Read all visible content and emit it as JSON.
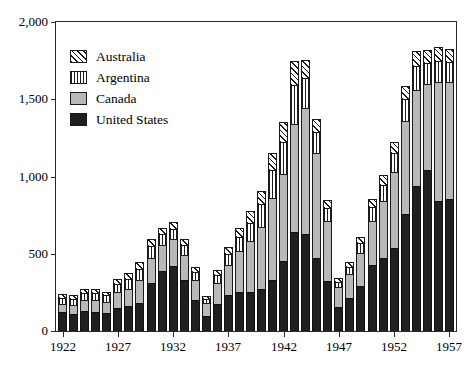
{
  "chart_data": {
    "type": "bar",
    "subtype": "stacked-vertical",
    "title": "",
    "subtitle": "",
    "xlabel": "",
    "ylabel": "",
    "grid": false,
    "legend_position": "upper-left-inside",
    "xlim": [
      1921.4,
      1957.6
    ],
    "ylim": [
      0,
      2000
    ],
    "ytick_values": [
      0,
      500,
      1000,
      1500,
      2000
    ],
    "ytick_labels": [
      "0",
      "500",
      "1,000",
      "1,500",
      "2,000"
    ],
    "xtick_values": [
      1922,
      1927,
      1932,
      1937,
      1942,
      1947,
      1952,
      1957
    ],
    "xtick_labels": [
      "1922",
      "1927",
      "1932",
      "1937",
      "1942",
      "1947",
      "1952",
      "1957"
    ],
    "x": [
      1922,
      1923,
      1924,
      1925,
      1926,
      1927,
      1928,
      1929,
      1930,
      1931,
      1932,
      1933,
      1934,
      1935,
      1936,
      1937,
      1938,
      1939,
      1940,
      1941,
      1942,
      1943,
      1944,
      1945,
      1946,
      1947,
      1948,
      1949,
      1950,
      1951,
      1952,
      1953,
      1954,
      1955,
      1956,
      1957
    ],
    "series": [
      {
        "name": "United States",
        "color": "#1f1f1f",
        "pattern": "solid-dark",
        "values": [
          120,
          110,
          130,
          125,
          115,
          150,
          165,
          180,
          310,
          390,
          420,
          330,
          200,
          95,
          175,
          235,
          250,
          255,
          270,
          330,
          450,
          640,
          625,
          470,
          325,
          155,
          215,
          290,
          430,
          470,
          540,
          760,
          940,
          1040,
          840,
          855
        ]
      },
      {
        "name": "Canada",
        "color": "#b9b9b9",
        "pattern": "light-gray",
        "values": [
          55,
          60,
          70,
          75,
          75,
          100,
          110,
          150,
          165,
          170,
          175,
          165,
          130,
          85,
          135,
          195,
          265,
          330,
          405,
          530,
          565,
          700,
          820,
          680,
          390,
          130,
          155,
          215,
          285,
          370,
          490,
          600,
          620,
          560,
          770,
          755
        ]
      },
      {
        "name": "Argentina",
        "color": "#ffffff",
        "pattern": "vertical-lines",
        "values": [
          40,
          35,
          45,
          45,
          40,
          55,
          60,
          70,
          75,
          65,
          65,
          60,
          50,
          30,
          50,
          70,
          95,
          115,
          145,
          185,
          210,
          255,
          195,
          140,
          80,
          35,
          45,
          65,
          85,
          105,
          120,
          140,
          155,
          135,
          140,
          130
        ]
      },
      {
        "name": "Australia",
        "color": "#ffffff",
        "pattern": "diagonal-hatch",
        "values": [
          25,
          25,
          30,
          30,
          25,
          35,
          40,
          45,
          45,
          45,
          45,
          40,
          35,
          20,
          35,
          45,
          60,
          75,
          85,
          110,
          130,
          155,
          115,
          85,
          50,
          25,
          30,
          40,
          55,
          65,
          75,
          85,
          95,
          85,
          90,
          85
        ]
      }
    ],
    "totals": [
      240,
      230,
      275,
      275,
      255,
      340,
      375,
      445,
      595,
      670,
      705,
      595,
      415,
      230,
      395,
      545,
      670,
      775,
      905,
      1155,
      1355,
      1750,
      1755,
      1375,
      845,
      345,
      445,
      610,
      855,
      1010,
      1225,
      1585,
      1810,
      1820,
      1840,
      1825
    ]
  },
  "legend": {
    "items": [
      {
        "label": "Australia",
        "swatch": "diagonal-hatch-swatch"
      },
      {
        "label": "Argentina",
        "swatch": "vertical-lines-swatch"
      },
      {
        "label": "Canada",
        "swatch": "light-gray-swatch"
      },
      {
        "label": "United States",
        "swatch": "solid-dark-swatch"
      }
    ]
  },
  "colors": {
    "united_states": "#1f1f1f",
    "canada": "#b9b9b9",
    "argentina": "#ffffff",
    "australia": "#ffffff",
    "axis": "#2b2b2b",
    "outline": "#1a1a1a",
    "background": "#ffffff"
  }
}
